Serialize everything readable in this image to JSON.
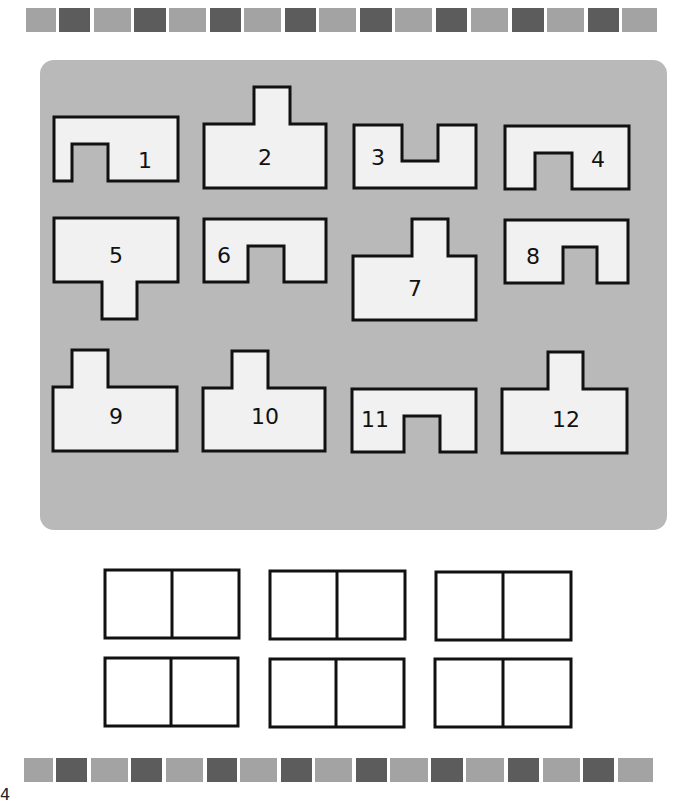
{
  "page": {
    "page_number": "4",
    "colors": {
      "panel_bg": "#b9b9b9",
      "shape_fill": "#f1f1f1",
      "shape_stroke": "#111111",
      "square_light": "#a3a3a3",
      "square_dark": "#5c5c5c"
    }
  },
  "top_strip": {
    "squares": [
      "light",
      "dark",
      "light",
      "dark",
      "light",
      "dark",
      "light",
      "dark",
      "light",
      "dark",
      "light",
      "dark",
      "light",
      "dark",
      "light",
      "dark",
      "light",
      "dark",
      "light"
    ]
  },
  "bottom_strip": {
    "squares": [
      "light",
      "dark",
      "light",
      "dark",
      "light",
      "dark",
      "light",
      "dark",
      "light",
      "dark",
      "light",
      "dark",
      "light",
      "dark",
      "light",
      "dark",
      "light",
      "dark",
      "light"
    ]
  },
  "shapes": [
    {
      "label": "1"
    },
    {
      "label": "2"
    },
    {
      "label": "3"
    },
    {
      "label": "4"
    },
    {
      "label": "5"
    },
    {
      "label": "6"
    },
    {
      "label": "7"
    },
    {
      "label": "8"
    },
    {
      "label": "9"
    },
    {
      "label": "10"
    },
    {
      "label": "11"
    },
    {
      "label": "12"
    }
  ],
  "answer_boxes": [
    {
      "left": "",
      "right": ""
    },
    {
      "left": "",
      "right": ""
    },
    {
      "left": "",
      "right": ""
    },
    {
      "left": "",
      "right": ""
    },
    {
      "left": "",
      "right": ""
    },
    {
      "left": "",
      "right": ""
    }
  ]
}
